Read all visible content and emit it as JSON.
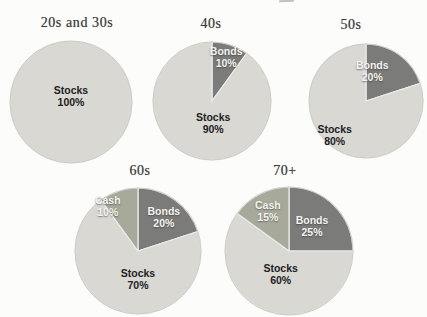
{
  "chart_data": {
    "type": "pie",
    "palette": {
      "Stocks": "#d9d8d3",
      "Bonds": "#7b7b79",
      "Cash": "#a7aa9b"
    },
    "separator_color": "#ecedeb",
    "rim_color": "#c3c3bd",
    "light_label_slices": [
      "Bonds",
      "Cash"
    ],
    "pies": [
      {
        "title": "20s and 30s",
        "title_cx": 77,
        "title_y": 15,
        "cx": 71,
        "cy": 102,
        "r": 61,
        "slices": [
          {
            "name": "Stocks",
            "pct": 100,
            "label": [
              0,
              -0.1
            ]
          }
        ]
      },
      {
        "title": "40s",
        "title_cx": 211,
        "title_y": 16,
        "cx": 212,
        "cy": 101,
        "r": 59,
        "slices": [
          {
            "name": "Bonds",
            "pct": 10,
            "label": [
              0.24,
              -0.75
            ]
          },
          {
            "name": "Stocks",
            "pct": 90,
            "label": [
              0.02,
              0.37
            ]
          }
        ]
      },
      {
        "title": "50s",
        "title_cx": 351,
        "title_y": 17,
        "cx": 366,
        "cy": 101,
        "r": 57,
        "slices": [
          {
            "name": "Bonds",
            "pct": 20,
            "label": [
              0.11,
              -0.52
            ]
          },
          {
            "name": "Stocks",
            "pct": 80,
            "label": [
              -0.55,
              0.6
            ]
          }
        ]
      },
      {
        "title": "60s",
        "title_cx": 140,
        "title_y": 163,
        "cx": 138,
        "cy": 251,
        "r": 63,
        "slices": [
          {
            "name": "Bonds",
            "pct": 20,
            "label": [
              0.41,
              -0.54
            ]
          },
          {
            "name": "Stocks",
            "pct": 70,
            "label": [
              0.0,
              0.44
            ]
          },
          {
            "name": "Cash",
            "pct": 10,
            "label": [
              -0.48,
              -0.71
            ]
          }
        ]
      },
      {
        "title": "70+",
        "title_cx": 285,
        "title_y": 163,
        "cx": 289,
        "cy": 251,
        "r": 64,
        "slices": [
          {
            "name": "Bonds",
            "pct": 25,
            "label": [
              0.36,
              -0.39
            ]
          },
          {
            "name": "Stocks",
            "pct": 60,
            "label": [
              -0.13,
              0.36
            ]
          },
          {
            "name": "Cash",
            "pct": 15,
            "label": [
              -0.33,
              -0.62
            ]
          }
        ]
      }
    ]
  }
}
